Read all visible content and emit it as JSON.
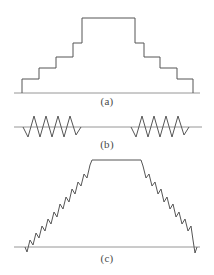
{
  "figure": {
    "background_color": "#ffffff",
    "stroke_color": "#555555",
    "axis_color": "#8a8a8a",
    "width": 214,
    "height": 275
  },
  "panels": [
    {
      "id": "a",
      "caption": "(a)",
      "kind": "staircase-pulse",
      "baseline_y": 93,
      "axis_x_start": 14,
      "axis_x_end": 200,
      "description": "Symmetric step pyramid with five ascending steps, a flat plateau, and five descending steps",
      "points": "22,93 22,79 39,79 39,68 56,68 56,57 73,57 73,43 82,43 82,18 135,18 135,43 144,43 144,57 160,57 160,68 177,68 177,79 193,79 193,93"
    },
    {
      "id": "b",
      "caption": "(b)",
      "kind": "oscillation-bursts",
      "baseline_y": 17,
      "axis_x_start": 14,
      "axis_x_end": 202,
      "description": "Two symmetric zigzag oscillation bursts separated by a quiet flat interval",
      "burst_left": "23,17 28,27 34,6 40,27 46,6 52,27 58,6 64,27 70,6 76,25 81,17",
      "burst_right": "131,17 136,27 142,6 148,27 154,6 160,27 166,6 172,27 178,6 184,25 189,17"
    },
    {
      "id": "c",
      "caption": "(c)",
      "kind": "noisy-trapezoid",
      "baseline_y": 95,
      "axis_x_start": 14,
      "axis_x_end": 200,
      "description": "Trapezoidal pulse with sawtooth noise on the rising and falling ramps and a clean flat top",
      "points": "25,95 27,100 30,88 33,93 36,81 39,86 42,74 45,79 48,67 51,72 54,60 57,65 60,52 63,57 66,45 69,50 72,37 75,42 78,30 81,34 84,22 87,26 90,13 92,8 141,8 143,14 146,26 149,22 152,34 155,30 158,42 161,37 164,50 167,45 170,57 173,52 176,65 179,60 182,72 185,67 188,79 191,74 193,88 195,101 197,95"
    }
  ]
}
